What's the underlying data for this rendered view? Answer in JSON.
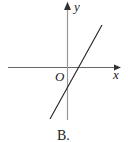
{
  "diagram": {
    "axes": {
      "x_label": "x",
      "y_label": "y",
      "origin_label": "O"
    },
    "line": {
      "description": "straight line with positive slope crossing x-axis to the right of origin and y-axis below origin"
    },
    "caption": "B.",
    "colors": {
      "axis": "#555555",
      "line": "#222222",
      "text": "#222222"
    }
  }
}
